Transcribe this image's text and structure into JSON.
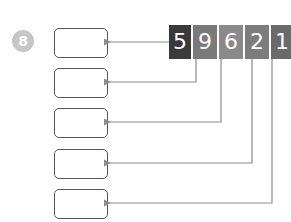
{
  "question": {
    "number": "8"
  },
  "number_tiles": [
    {
      "digit": "5",
      "color": "#3a3a3a"
    },
    {
      "digit": "9",
      "color": "#7a7a7a"
    },
    {
      "digit": "6",
      "color": "#8a8a8a"
    },
    {
      "digit": "2",
      "color": "#7c7c7c"
    },
    {
      "digit": "1",
      "color": "#6a6a6a"
    }
  ],
  "answer_boxes": [
    "",
    "",
    "",
    "",
    ""
  ],
  "colors": {
    "arrow": "#8c8c8c",
    "box_border": "#555555",
    "badge": "#c6c6c6"
  }
}
